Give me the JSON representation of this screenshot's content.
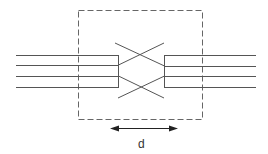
{
  "diagram": {
    "type": "crosstalk/crossover schematic",
    "dimension_label": "d",
    "colors": {
      "line": "#555555",
      "dash": "#666666",
      "arrow": "#222222"
    }
  }
}
